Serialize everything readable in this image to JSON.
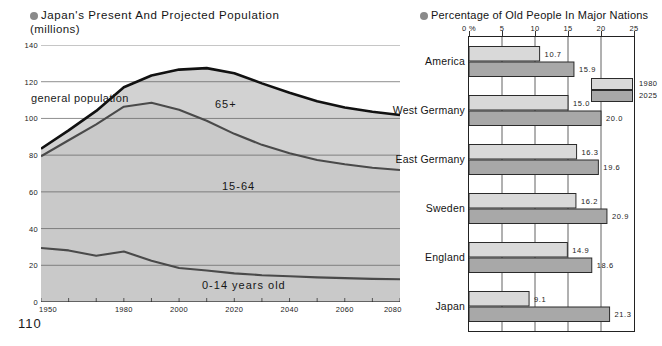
{
  "page_number": "110",
  "left_chart": {
    "title": "Japan's Present And Projected Population",
    "subtitle": "(millions)",
    "bullet_icon": "bullet-circle-icon",
    "labels": {
      "general_population": "general population",
      "band_65": "65+",
      "band_1564": "15-64",
      "band_014": "0-14 years old"
    },
    "chart_data": {
      "type": "area",
      "title": "Japan's Present And Projected Population (millions)",
      "xlabel": "",
      "ylabel": "(millions)",
      "xlim": [
        1950,
        2080
      ],
      "ylim": [
        0,
        140
      ],
      "xticks": [
        "1950",
        "1980",
        "2000",
        "2020",
        "2040",
        "2060",
        "2080"
      ],
      "xtick_values": [
        1950,
        1980,
        2000,
        2020,
        2040,
        2060,
        2080
      ],
      "yticks": [
        "0",
        "20",
        "40",
        "60",
        "80",
        "100",
        "120",
        "140"
      ],
      "ytick_values": [
        0,
        20,
        40,
        60,
        80,
        100,
        120,
        140
      ],
      "grid": true,
      "legend": "inline-band-labels",
      "x": [
        1950,
        1960,
        1970,
        1980,
        1990,
        2000,
        2010,
        2020,
        2030,
        2040,
        2050,
        2060,
        2070,
        2080
      ],
      "series": [
        {
          "name": "0-14 years old",
          "values": [
            29.4,
            28.1,
            25.2,
            27.5,
            22.5,
            18.5,
            17.2,
            15.6,
            14.6,
            14.0,
            13.4,
            13.0,
            12.6,
            12.4
          ]
        },
        {
          "name": "15-64",
          "values": [
            50.0,
            60.0,
            71.6,
            78.9,
            86.0,
            86.2,
            81.5,
            76.0,
            71.0,
            67.0,
            64.0,
            62.0,
            60.5,
            59.5
          ]
        },
        {
          "name": "65+",
          "values": [
            4.1,
            5.4,
            7.3,
            10.6,
            14.9,
            21.9,
            28.7,
            33.0,
            33.5,
            33.0,
            32.0,
            31.0,
            30.5,
            30.0
          ]
        }
      ],
      "total_line": {
        "name": "general population",
        "values": [
          83.5,
          93.5,
          104.1,
          117.0,
          123.4,
          126.6,
          127.4,
          124.6,
          119.1,
          114.0,
          109.4,
          106.0,
          103.6,
          101.9
        ]
      },
      "annotations": [
        {
          "text": "general population",
          "note": "points to the total-population curve"
        },
        {
          "text": "65+",
          "note": "top band"
        },
        {
          "text": "15-64",
          "note": "middle band"
        },
        {
          "text": "0-14 years old",
          "note": "bottom band"
        }
      ]
    }
  },
  "right_chart": {
    "title": "Percentage of Old People In Major Nations",
    "bullet_icon": "bullet-circle-icon",
    "legend": [
      {
        "label": "1980",
        "color": "#d9d9d9"
      },
      {
        "label": "2025",
        "color": "#a8a8a8"
      }
    ],
    "axis_ticks": [
      "0 %",
      "5",
      "10",
      "15",
      "20",
      "25"
    ],
    "chart_data": {
      "type": "bar",
      "orientation": "horizontal",
      "title": "Percentage of Old People In Major Nations",
      "xlabel": "%",
      "ylabel": "",
      "xlim": [
        0,
        25
      ],
      "xticks": [
        "0 %",
        "5",
        "10",
        "15",
        "20",
        "25"
      ],
      "xtick_values": [
        0,
        5,
        10,
        15,
        20,
        25
      ],
      "grid": true,
      "legend_position": "top-right-inside",
      "categories": [
        "America",
        "West Germany",
        "East Germany",
        "Sweden",
        "England",
        "Japan"
      ],
      "series": [
        {
          "name": "1980",
          "color": "#d9d9d9",
          "values": [
            10.7,
            15.0,
            16.3,
            16.2,
            14.9,
            9.1
          ]
        },
        {
          "name": "2025",
          "color": "#a8a8a8",
          "values": [
            15.9,
            20.0,
            19.6,
            20.9,
            18.6,
            21.3
          ]
        }
      ],
      "data_labels": [
        {
          "category": "America",
          "1980": "10.7",
          "2025": "15.9"
        },
        {
          "category": "West Germany",
          "1980": "15.0",
          "2025": "20.0"
        },
        {
          "category": "East Germany",
          "1980": "16.3",
          "2025": "19.6"
        },
        {
          "category": "Sweden",
          "1980": "16.2",
          "2025": "20.9"
        },
        {
          "category": "England",
          "1980": "14.9",
          "2025": "18.6"
        },
        {
          "category": "Japan",
          "1980": "9.1",
          "2025": "21.3"
        }
      ]
    }
  },
  "colors": {
    "band_fill": "#c9c9c9",
    "band_fill_light": "#d2d2d2",
    "band_line": "#4a4a4a",
    "total_line": "#111111",
    "bar_1980": "#d9d9d9",
    "bar_2025": "#a8a8a8",
    "frame": "#222222"
  }
}
